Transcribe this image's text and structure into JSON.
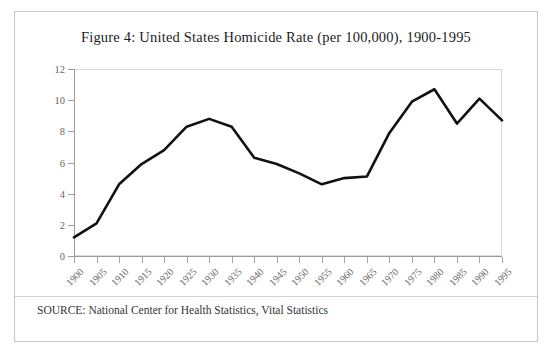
{
  "figure": {
    "title": "Figure 4: United States Homicide Rate (per 100,000), 1900-1995",
    "source": "SOURCE: National Center for Health Statistics, Vital Statistics"
  },
  "chart_data": {
    "type": "line",
    "title": "Figure 4: United States Homicide Rate (per 100,000), 1900-1995",
    "xlabel": "",
    "ylabel": "",
    "ylim": [
      0,
      12
    ],
    "yticks": [
      0,
      2,
      4,
      6,
      8,
      10,
      12
    ],
    "xlim": [
      1900,
      1995
    ],
    "grid": false,
    "legend": null,
    "line_color": "#111111",
    "categories": [
      "1900",
      "1905",
      "1910",
      "1915",
      "1920",
      "1925",
      "1930",
      "1935",
      "1940",
      "1945",
      "1950",
      "1955",
      "1960",
      "1965",
      "1970",
      "1975",
      "1980",
      "1985",
      "1990",
      "1995"
    ],
    "x": [
      1900,
      1905,
      1910,
      1915,
      1920,
      1925,
      1930,
      1935,
      1940,
      1945,
      1950,
      1955,
      1960,
      1965,
      1970,
      1975,
      1980,
      1985,
      1990,
      1995
    ],
    "values": [
      1.2,
      2.1,
      4.6,
      5.9,
      6.8,
      8.3,
      8.8,
      8.3,
      6.3,
      5.9,
      5.3,
      4.6,
      5.0,
      5.1,
      7.9,
      9.9,
      10.7,
      8.5,
      10.1,
      8.7
    ]
  }
}
